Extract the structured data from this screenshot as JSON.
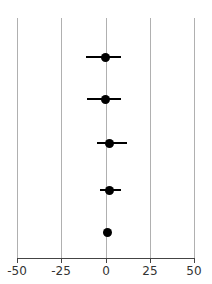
{
  "chart_data": {
    "type": "scatter",
    "subtype": "forest-plot",
    "title": "",
    "subtitle": "",
    "xlabel": "",
    "ylabel": "",
    "xlim": [
      -50,
      50
    ],
    "xticks": [
      -50,
      -25,
      0,
      25,
      50
    ],
    "xtick_labels": [
      "-50",
      "-25",
      "0",
      "25",
      "50"
    ],
    "grid": true,
    "grid_axis": "x",
    "legend": false,
    "legend_position": "none",
    "reference_line": 0,
    "marker_color": "#000000",
    "grid_color": "#b0b0b0",
    "axis_color": "#444444",
    "background_color": "#ffffff",
    "n_rows": 5,
    "rows": [
      {
        "index": 1,
        "label": "",
        "estimate": 0.0,
        "ci_low": -11.0,
        "ci_high": 9.0
      },
      {
        "index": 2,
        "label": "",
        "estimate": 0.0,
        "ci_low": -10.5,
        "ci_high": 9.0
      },
      {
        "index": 3,
        "label": "",
        "estimate": 2.0,
        "ci_low": -5.0,
        "ci_high": 12.0
      },
      {
        "index": 4,
        "label": "",
        "estimate": 2.5,
        "ci_low": -3.0,
        "ci_high": 9.0
      },
      {
        "index": 5,
        "label": "",
        "estimate": 1.0,
        "ci_low": 0.0,
        "ci_high": 2.0
      }
    ]
  },
  "axis": {
    "ticks": [
      {
        "value": -50,
        "label": "-50"
      },
      {
        "value": -25,
        "label": "-25"
      },
      {
        "value": 0,
        "label": "0"
      },
      {
        "value": 25,
        "label": "25"
      },
      {
        "value": 50,
        "label": "50"
      }
    ]
  }
}
